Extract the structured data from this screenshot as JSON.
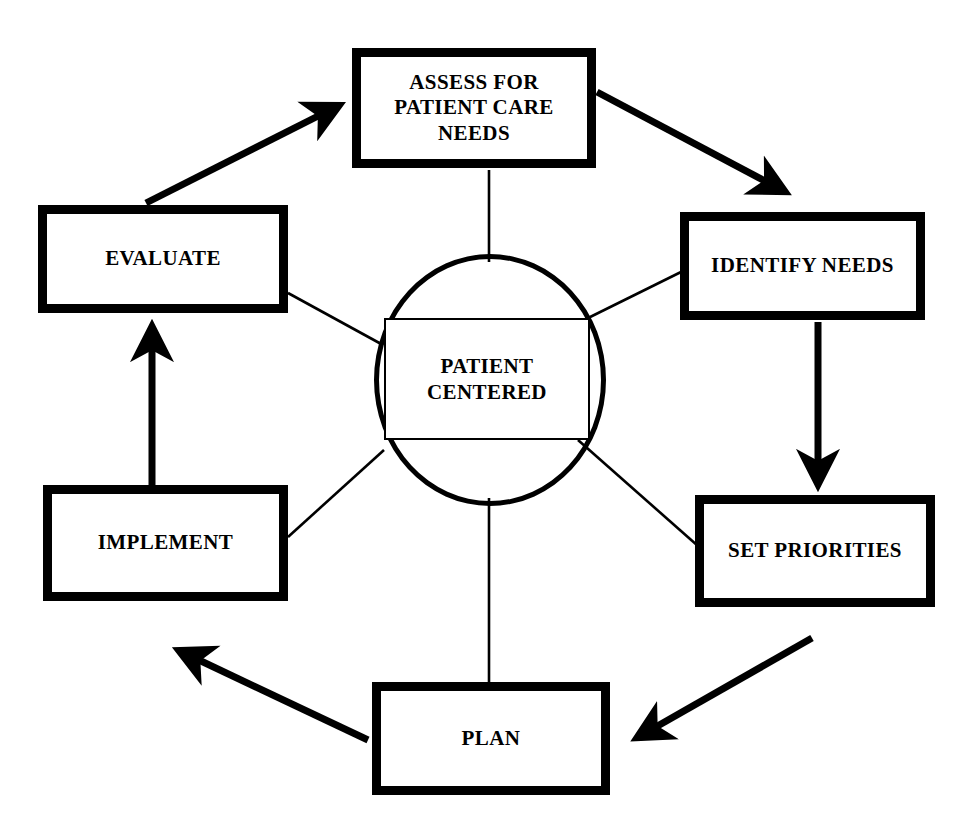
{
  "diagram": {
    "background_color": "#ffffff",
    "line_color": "#000000",
    "center": {
      "name": "patient-centered-hub",
      "label": "PATIENT\nCENTERED",
      "line1": "PATIENT",
      "line2": "CENTERED",
      "shape": "ellipse-with-rectangle"
    },
    "nodes": [
      {
        "id": "assess",
        "label": "ASSESS FOR PATIENT CARE NEEDS",
        "lines": [
          "ASSESS FOR",
          "PATIENT CARE",
          "NEEDS"
        ],
        "position": "top"
      },
      {
        "id": "identify",
        "label": "IDENTIFY NEEDS",
        "lines": [
          "IDENTIFY NEEDS"
        ],
        "position": "right-top"
      },
      {
        "id": "priorities",
        "label": "SET PRIORITIES",
        "lines": [
          "SET PRIORITIES"
        ],
        "position": "right-bottom"
      },
      {
        "id": "plan",
        "label": "PLAN",
        "lines": [
          "PLAN"
        ],
        "position": "bottom"
      },
      {
        "id": "implement",
        "label": "IMPLEMENT",
        "lines": [
          "IMPLEMENT"
        ],
        "position": "left-bottom"
      },
      {
        "id": "evaluate",
        "label": "EVALUATE",
        "lines": [
          "EVALUATE"
        ],
        "position": "left-top"
      }
    ],
    "flow_arrows": [
      {
        "from": "assess",
        "to": "identify",
        "style": "thick-diagonal-down-right"
      },
      {
        "from": "identify",
        "to": "priorities",
        "style": "thick-vertical-down"
      },
      {
        "from": "priorities",
        "to": "plan",
        "style": "thick-diagonal-down-left"
      },
      {
        "from": "plan",
        "to": "implement",
        "style": "thick-diagonal-up-left"
      },
      {
        "from": "implement",
        "to": "evaluate",
        "style": "thick-vertical-up"
      },
      {
        "from": "evaluate",
        "to": "assess",
        "style": "thick-diagonal-up-right"
      }
    ],
    "spokes": [
      {
        "from": "assess",
        "to": "patient-centered-hub"
      },
      {
        "from": "identify",
        "to": "patient-centered-hub"
      },
      {
        "from": "priorities",
        "to": "patient-centered-hub"
      },
      {
        "from": "plan",
        "to": "patient-centered-hub"
      },
      {
        "from": "implement",
        "to": "patient-centered-hub"
      },
      {
        "from": "evaluate",
        "to": "patient-centered-hub"
      }
    ]
  }
}
